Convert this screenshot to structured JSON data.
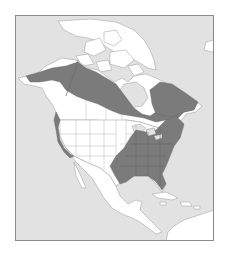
{
  "map": {
    "type": "species-range-map",
    "region": "North America",
    "colors": {
      "ocean": "#e2e2e2",
      "land": "#ffffff",
      "range": "#7b7b7b",
      "frame": "#8a8a8a",
      "borders": "#a8a8a8"
    },
    "layers": [
      {
        "id": "greenland",
        "label": ""
      },
      {
        "id": "iceland",
        "label": ""
      },
      {
        "id": "arctic-archipelago",
        "label": ""
      },
      {
        "id": "alaska-canada",
        "label": ""
      },
      {
        "id": "usa",
        "label": ""
      },
      {
        "id": "mexico-central-america",
        "label": ""
      },
      {
        "id": "caribbean",
        "label": ""
      },
      {
        "id": "south-america",
        "label": ""
      },
      {
        "id": "range-boreal",
        "label": ""
      },
      {
        "id": "range-eastern",
        "label": ""
      },
      {
        "id": "range-pacific-coast",
        "label": ""
      }
    ]
  }
}
